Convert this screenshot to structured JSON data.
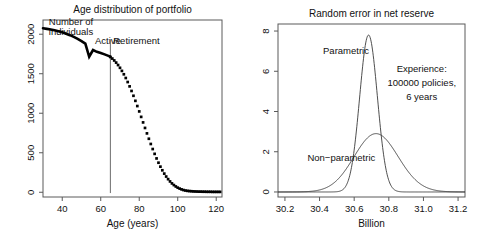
{
  "figure": {
    "background": "#ffffff",
    "foreground": "#111111",
    "panel_count": 2
  },
  "chart_data": [
    {
      "id": "age-distribution",
      "type": "line",
      "title": "Age distribution of portfolio",
      "xlabel": "Age (years)",
      "ylabel": "",
      "xlim": [
        30,
        123
      ],
      "ylim": [
        -60,
        2180
      ],
      "xticks": [
        40,
        60,
        80,
        100,
        120
      ],
      "yticks": [
        0,
        500,
        1000,
        1500,
        2000
      ],
      "ytick_labels": [
        "0",
        "500",
        "1000",
        "1500",
        "2000"
      ],
      "xtick_labels": [
        "40",
        "60",
        "80",
        "100",
        "120"
      ],
      "grid": false,
      "legend": "none",
      "inside_labels": [
        {
          "name": "y-axis-caption",
          "text": "Number of",
          "x": 33,
          "y": 2120
        },
        {
          "name": "y-axis-caption-2",
          "text": "individuals",
          "x": 33,
          "y": 1990
        },
        {
          "name": "active-label",
          "text": "Active",
          "x": 57,
          "y": 1880
        },
        {
          "name": "retirement-label",
          "text": "Retirement",
          "x": 66.5,
          "y": 1880
        }
      ],
      "vline": {
        "name": "retirement-age-line",
        "x": 65,
        "y_from": -10,
        "y_to": 1930,
        "color": "#6b6b6b"
      },
      "series": [
        {
          "name": "Active portion (solid)",
          "style": "solid",
          "x": [
            30,
            32,
            34,
            36,
            38,
            40,
            42,
            44,
            46,
            48,
            50,
            52,
            54,
            56,
            58,
            60,
            62,
            64,
            65
          ],
          "values": [
            2075,
            2068,
            2060,
            2050,
            2038,
            2024,
            2007,
            1988,
            1966,
            1941,
            1913,
            1882,
            1715,
            1800,
            1777,
            1762,
            1745,
            1726,
            1715
          ]
        },
        {
          "name": "Retirement portion (dotted)",
          "style": "dotted",
          "x": [
            65,
            66,
            67,
            68,
            69,
            70,
            71,
            72,
            73,
            74,
            75,
            76,
            77,
            78,
            79,
            80,
            81,
            82,
            83,
            84,
            85,
            86,
            87,
            88,
            89,
            90,
            91,
            92,
            93,
            94,
            95,
            96,
            97,
            98,
            99,
            100,
            101,
            102,
            103,
            104,
            105,
            106,
            107,
            108,
            109,
            110,
            111,
            112,
            113,
            114,
            115,
            116,
            117,
            118,
            119,
            120,
            121,
            122
          ],
          "values": [
            1712,
            1692,
            1668,
            1641,
            1610,
            1575,
            1536,
            1493,
            1446,
            1395,
            1340,
            1282,
            1221,
            1157,
            1091,
            1023,
            954,
            884,
            814,
            745,
            677,
            611,
            547,
            486,
            428,
            374,
            324,
            278,
            236,
            199,
            166,
            137,
            112,
            91,
            73,
            58,
            46,
            36,
            28,
            22,
            18,
            15,
            13,
            11,
            10,
            9,
            8,
            8,
            7,
            7,
            6,
            6,
            6,
            5,
            5,
            5,
            5,
            5
          ]
        }
      ]
    },
    {
      "id": "random-error-net-reserve",
      "type": "line",
      "title": "Random error in net reserve",
      "xlabel": "Billion",
      "ylabel": "",
      "xlim": [
        30.16,
        31.24
      ],
      "ylim": [
        -0.25,
        8.35
      ],
      "xticks": [
        30.2,
        30.4,
        30.6,
        30.8,
        31.0,
        31.2
      ],
      "xtick_labels": [
        "30.2",
        "30.4",
        "30.6",
        "30.8",
        "31.0",
        "31.2"
      ],
      "yticks": [
        0,
        2,
        4,
        6,
        8
      ],
      "ytick_labels": [
        "0",
        "2",
        "4",
        "6",
        "8"
      ],
      "grid": false,
      "legend": "inline-annotations",
      "inside_labels": [
        {
          "name": "parametric-label",
          "text": "Parametric",
          "x": 30.42,
          "y": 6.85
        },
        {
          "name": "nonparametric-label",
          "text": "Non−parametric",
          "x": 30.33,
          "y": 1.55
        },
        {
          "name": "experience-line-1",
          "text": "Experience:",
          "x": 30.99,
          "y": 5.95
        },
        {
          "name": "experience-line-2",
          "text": "100000 policies,",
          "x": 30.99,
          "y": 5.25
        },
        {
          "name": "experience-line-3",
          "text": "6 years",
          "x": 30.99,
          "y": 4.55
        }
      ],
      "series": [
        {
          "name": "Parametric",
          "style": "thin",
          "distribution": "normal",
          "mean": 30.683,
          "sd": 0.0512,
          "peak": 7.8
        },
        {
          "name": "Non−parametric",
          "style": "thin",
          "distribution": "skewed-normal",
          "mean": 30.675,
          "sd": 0.138,
          "skew": 0.55,
          "peak": 2.9
        }
      ]
    }
  ]
}
